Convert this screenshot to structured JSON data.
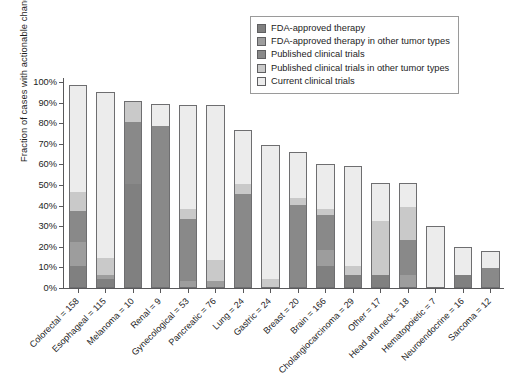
{
  "chart_data": {
    "type": "bar",
    "subtype": "stacked-vertical",
    "title": "",
    "xlabel": "",
    "ylabel": "Fraction of cases with actionable changes (%)",
    "ylim": [
      0,
      100
    ],
    "yticks": [
      "0%",
      "10%",
      "20%",
      "30%",
      "40%",
      "50%",
      "60%",
      "70%",
      "80%",
      "90%",
      "100%"
    ],
    "grid": false,
    "legend_position": "top-right",
    "legend": [
      {
        "name": "FDA-approved therapy",
        "color": "#808080"
      },
      {
        "name": "FDA-approved therapy in other tumor types",
        "color": "#9d9d9d"
      },
      {
        "name": "Published clinical trials",
        "color": "#898989"
      },
      {
        "name": "Published clinical trials in other tumor types",
        "color": "#c9c9c9"
      },
      {
        "name": "Current clinical trials",
        "color": "#ececec"
      }
    ],
    "categories": [
      "Colorectal = 158",
      "Esophageal = 115",
      "Melanoma = 10",
      "Renal = 9",
      "Gynecological = 53",
      "Pancreatic = 76",
      "Lung = 24",
      "Gastric = 24",
      "Breast = 20",
      "Brain = 166",
      "Cholangiocarcinoma = 29",
      "Other = 17",
      "Head and neck = 18",
      "Hematopoietic = 7",
      "Neuroendocrine = 16",
      "Sarcoma = 12"
    ],
    "series": [
      {
        "name": "FDA-approved therapy",
        "color": "#808080",
        "values": [
          10,
          4,
          50,
          0,
          0,
          0,
          0,
          0,
          0,
          10,
          6,
          6,
          0,
          0,
          6,
          0
        ]
      },
      {
        "name": "FDA-approved therapy in other tumor types",
        "color": "#9d9d9d",
        "values": [
          12,
          2,
          0,
          0,
          3,
          3,
          0,
          0,
          0,
          8,
          0,
          0,
          6,
          0,
          0,
          0
        ]
      },
      {
        "name": "Published clinical trials",
        "color": "#898989",
        "values": [
          15,
          0,
          30,
          78,
          30,
          0,
          45,
          0,
          40,
          17,
          0,
          0,
          17,
          0,
          0,
          9
        ]
      },
      {
        "name": "Published clinical trials in other tumor types",
        "color": "#c9c9c9",
        "values": [
          9,
          8,
          10,
          0,
          5,
          10,
          5,
          4,
          3,
          3,
          4,
          26,
          16,
          0,
          0,
          0
        ]
      },
      {
        "name": "Current clinical trials",
        "color": "#ececec",
        "values": [
          51.5,
          80,
          0,
          10.5,
          50,
          75,
          25.5,
          64.5,
          22,
          21,
          48.5,
          18,
          11,
          29,
          13,
          8
        ]
      }
    ],
    "totals": [
      97.5,
      94,
      90,
      88.5,
      88,
      88,
      75.5,
      68.5,
      65,
      59,
      58.5,
      50,
      50,
      29,
      19,
      17
    ]
  }
}
